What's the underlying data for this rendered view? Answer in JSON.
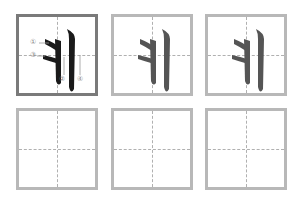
{
  "worksheet": {
    "character": "丬",
    "rows": [
      {
        "cells": [
          {
            "type": "stroke-order",
            "char": "丬",
            "color": "#1a1a1a",
            "labels": [
              "①",
              "②",
              "③",
              "④"
            ]
          },
          {
            "type": "trace",
            "char": "丬",
            "color": "#555555"
          },
          {
            "type": "trace",
            "char": "丬",
            "color": "#555555"
          }
        ]
      },
      {
        "cells": [
          {
            "type": "blank"
          },
          {
            "type": "blank"
          },
          {
            "type": "blank"
          }
        ]
      }
    ],
    "colors": {
      "grid_border": "#b8b8b8",
      "first_border": "#7a7a7a",
      "guide": "#b0b0b0"
    }
  }
}
